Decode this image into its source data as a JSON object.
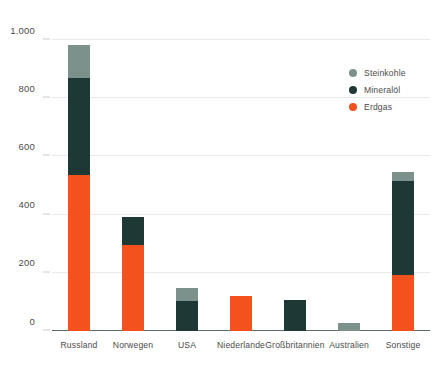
{
  "chart_data": {
    "type": "bar",
    "stacked": true,
    "title": "",
    "subtitle": "",
    "xlabel": "",
    "ylabel": "",
    "ylim": [
      0,
      1000
    ],
    "yticks": [
      0,
      200,
      400,
      600,
      800,
      1000
    ],
    "ytick_labels": [
      "0",
      "200",
      "400",
      "600",
      "800",
      "1.000"
    ],
    "grid": true,
    "legend_position": "top-right",
    "categories": [
      "Russland",
      "Norwegen",
      "USA",
      "Niederlande",
      "Großbritannien",
      "Australien",
      "Sonstige"
    ],
    "series": [
      {
        "name": "Erdgas",
        "color": "#f4511e",
        "values": [
          535,
          297,
          0,
          120,
          0,
          0,
          192
        ]
      },
      {
        "name": "Mineralöl",
        "color": "#1e3836",
        "values": [
          335,
          95,
          103,
          0,
          105,
          0,
          325
        ]
      },
      {
        "name": "Steinkohle",
        "color": "#7d918c",
        "values": [
          113,
          0,
          44,
          0,
          0,
          27,
          31
        ]
      }
    ],
    "totals": [
      983,
      392,
      147,
      120,
      105,
      27,
      548
    ]
  },
  "legend": {
    "items": [
      {
        "label": "Steinkohle",
        "color": "#7d918c"
      },
      {
        "label": "Mineralöl",
        "color": "#1e3836"
      },
      {
        "label": "Erdgas",
        "color": "#f4511e"
      }
    ]
  },
  "axis": {
    "y_labels": [
      "1.000",
      "800",
      "600",
      "400",
      "200",
      "0"
    ],
    "x_labels": [
      "Russland",
      "Norwegen",
      "USA",
      "Niederlande",
      "Großbritannien",
      "Australien",
      "Sonstige"
    ]
  }
}
